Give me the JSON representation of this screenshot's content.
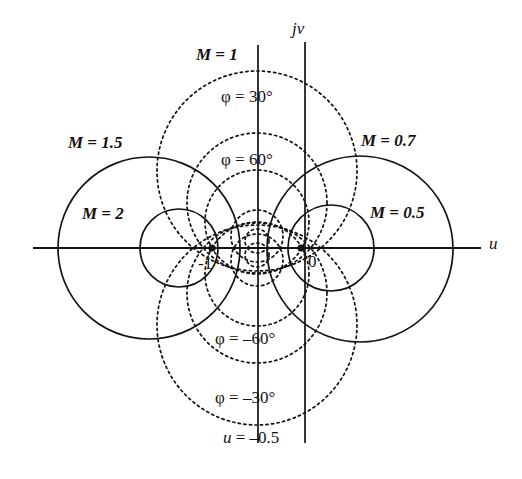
{
  "figure": {
    "kind": "constant-M and constant-phase circles in the complex u + jv plane",
    "background_color": "#ffffff",
    "ink_color": "#14110f"
  },
  "axes": {
    "horizontal": {
      "label": "u",
      "label_x": 489,
      "label_y": 235,
      "y": 248,
      "x_start": 33,
      "x_end": 481
    },
    "vertical": {
      "label": "jv",
      "label_x": 294,
      "label_y": 22,
      "x": 305,
      "y_start": 42,
      "y_end": 443
    },
    "origin": {
      "x": 301,
      "y": 248,
      "unit_px": 89
    }
  },
  "points": [
    {
      "name": "minus-one",
      "label": "-1",
      "cx": 212,
      "cy": 248,
      "label_x": 200,
      "label_y": 255
    },
    {
      "name": "origin-zero",
      "label": "0",
      "cx": 301,
      "cy": 248,
      "label_x": 307,
      "label_y": 254
    }
  ],
  "m_line": {
    "label": "M = 1",
    "x": 258,
    "y_start": 45,
    "y_end": 443,
    "label_x": 196,
    "label_y": 48
  },
  "m_circles": [
    {
      "label": "M = 1.5",
      "value": 1.5,
      "cx": 149,
      "cy": 248,
      "r": 91,
      "label_x": 70,
      "label_y": 135
    },
    {
      "label": "M = 2",
      "value": 2,
      "cx": 179,
      "cy": 248,
      "r": 39,
      "label_x": 82,
      "label_y": 206
    },
    {
      "label": "M = 0.7",
      "value": 0.7,
      "cx": 360,
      "cy": 249,
      "r": 93,
      "label_x": 362,
      "label_y": 133
    },
    {
      "label": "M = 0.5",
      "value": 0.5,
      "cx": 331,
      "cy": 248,
      "r": 43,
      "label_x": 371,
      "label_y": 205
    }
  ],
  "phase_circles": [
    {
      "label": "φ = 30°",
      "value": 30,
      "cx": 257,
      "cy": 171,
      "r": 100,
      "label_x": 222,
      "label_y": 89
    },
    {
      "label": "φ = 60°",
      "value": 60,
      "cx": 257,
      "cy": 222,
      "r": 52,
      "label_x": 222,
      "label_y": 152
    },
    {
      "label": "φ = -60°",
      "value": -60,
      "cx": 257,
      "cy": 274,
      "r": 52,
      "label_x": 216,
      "label_y": 331
    },
    {
      "label": "φ = -30°",
      "value": -30,
      "cx": 257,
      "cy": 325,
      "r": 100,
      "label_x": 216,
      "label_y": 390
    }
  ],
  "phase_circles_minor": [
    {
      "value": 75,
      "cx": 257,
      "cy": 236,
      "r": 24
    },
    {
      "value": 85,
      "cx": 257,
      "cy": 244,
      "r": 9
    },
    {
      "value": -75,
      "cx": 257,
      "cy": 260,
      "r": 24
    },
    {
      "value": -85,
      "cx": 257,
      "cy": 252,
      "r": 9
    },
    {
      "value": 45,
      "cx": 257,
      "cy": 203,
      "r": 70
    },
    {
      "value": -45,
      "cx": 257,
      "cy": 293,
      "r": 70
    }
  ],
  "u_line": {
    "label": "u = -0.5",
    "x": 305,
    "label_x": 224,
    "label_y": 430
  },
  "labels": {
    "m_1": "M = 1",
    "m_15": "M = 1.5",
    "m_2": "M = 2",
    "m_07": "M = 0.7",
    "m_05": "M = 0.5",
    "phi_30": "φ = 30°",
    "phi_60": "φ = 60°",
    "phi_m60": "φ = –60°",
    "phi_m30": "φ = –30°",
    "u_axis": "u",
    "jv_axis": "jv",
    "u_eq": "u = –0.5",
    "pt_minus_one": "-1",
    "pt_zero": "0"
  }
}
